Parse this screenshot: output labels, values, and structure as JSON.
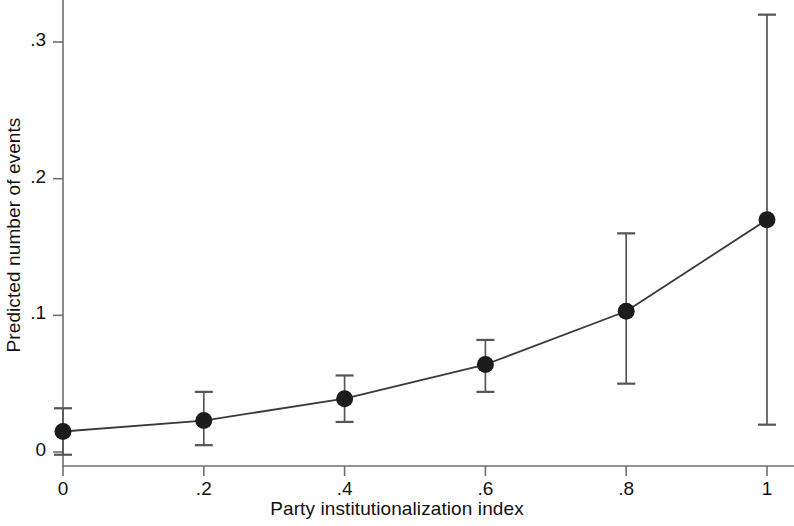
{
  "chart_data": {
    "type": "line",
    "title": "",
    "subtitle": "",
    "xlabel": "Party institutionalization index",
    "ylabel": "Predicted number of events",
    "xlim": [
      -0.025,
      1.04
    ],
    "ylim": [
      -0.012,
      0.332
    ],
    "xticks": [
      0,
      0.2,
      0.4,
      0.6,
      0.8,
      1
    ],
    "xticklabels": [
      "0",
      ".2",
      ".4",
      ".6",
      ".8",
      "1"
    ],
    "yticks": [
      0,
      0.1,
      0.2,
      0.3
    ],
    "yticklabels": [
      "0",
      ".1",
      ".2",
      ".3"
    ],
    "grid": false,
    "legend": "none",
    "marker": "filled-circle",
    "error_bars": "capped-vertical",
    "x": [
      0,
      0.2,
      0.4,
      0.6,
      0.8,
      1
    ],
    "series": [
      {
        "name": "Predicted number of events",
        "values": [
          0.015,
          0.023,
          0.039,
          0.064,
          0.103,
          0.17
        ],
        "ci_lower": [
          -0.002,
          0.005,
          0.022,
          0.044,
          0.05,
          0.02
        ],
        "ci_upper": [
          0.032,
          0.044,
          0.056,
          0.082,
          0.16,
          0.32
        ],
        "color": "#333333"
      }
    ],
    "annotations": []
  },
  "axes": {
    "x_title": "Party institutionalization index",
    "y_title": "Predicted number of events"
  }
}
